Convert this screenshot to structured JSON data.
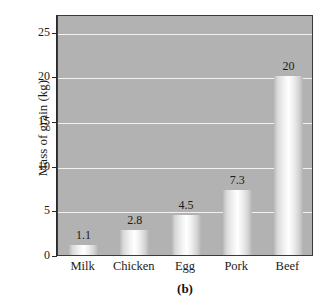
{
  "chart_data": {
    "type": "bar",
    "title": "",
    "categories": [
      "Milk",
      "Chicken",
      "Egg",
      "Pork",
      "Beef"
    ],
    "values": [
      1.1,
      2.8,
      4.5,
      7.3,
      20
    ],
    "value_labels": [
      "1.1",
      "2.8",
      "4.5",
      "7.3",
      "20"
    ],
    "xlabel": "",
    "ylabel": "Mass of grain (kg)",
    "ylim": [
      0,
      27
    ],
    "yticks": [
      0,
      5,
      10,
      15,
      20,
      25
    ],
    "ytick_labels": [
      "0",
      "5",
      "10",
      "15",
      "20",
      "25"
    ],
    "gridlines": [
      5,
      10,
      15,
      20,
      25
    ],
    "grid": true,
    "legend": null,
    "caption": "(b)",
    "colors": {
      "plot_background": "#b2b2b2",
      "gridline": "#f2f2f2",
      "bar_light": "#ffffff",
      "bar_dark": "#b4b4b4",
      "axis": "#2a2a2a",
      "text": "#1b1b1b",
      "page_background": "#ffffff"
    }
  }
}
